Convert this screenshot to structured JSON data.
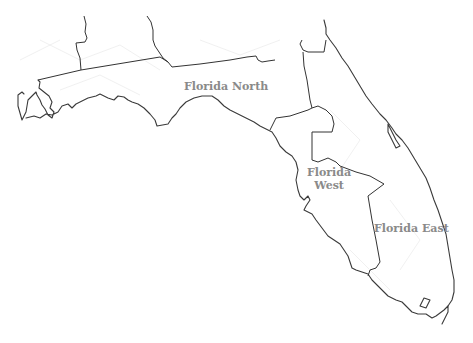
{
  "map": {
    "title": "Florida regions",
    "regions": [
      {
        "id": "north",
        "label": "Florida North",
        "x": 185,
        "y": 80
      },
      {
        "id": "west",
        "label_line1": "Florida",
        "label_line2": "West",
        "x": 308,
        "y": 167
      },
      {
        "id": "east",
        "label": "Florida East",
        "x": 374,
        "y": 222
      }
    ],
    "colors": {
      "outline": "#3a3a3a",
      "label": "#8a8a8a",
      "background": "#ffffff"
    }
  }
}
